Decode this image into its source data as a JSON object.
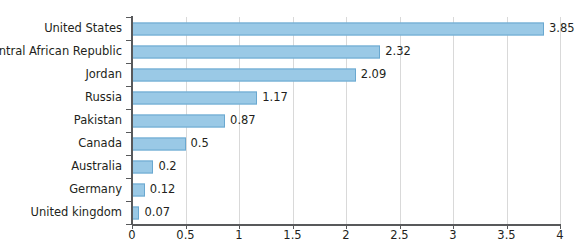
{
  "chart_data": {
    "type": "bar",
    "orientation": "horizontal",
    "title": "",
    "subtitle": "",
    "xlabel": "",
    "ylabel": "",
    "xlim": [
      0,
      4
    ],
    "grid": true,
    "legend": null,
    "xticks": [
      "0",
      "0.5",
      "1",
      "1.5",
      "2",
      "2.5",
      "3",
      "3.5",
      "4"
    ],
    "xtick_values": [
      0,
      0.5,
      1,
      1.5,
      2,
      2.5,
      3,
      3.5,
      4
    ],
    "categories": [
      "United States",
      "Central African Republic",
      "Jordan",
      "Russia",
      "Pakistan",
      "Canada",
      "Australia",
      "Germany",
      "United kingdom"
    ],
    "values": [
      3.85,
      2.32,
      2.09,
      1.17,
      0.87,
      0.5,
      0.2,
      0.12,
      0.07
    ],
    "value_labels": [
      "3.85",
      "2.32",
      "2.09",
      "1.17",
      "0.87",
      "0.5",
      "0.2",
      "0.12",
      "0.07"
    ],
    "colors": {
      "bar_fill": "#9ac9e6",
      "bar_border": "#6aa8d0",
      "gridline": "#d9d9d9",
      "axis": "#58595b",
      "text": "#231f20",
      "background": "#ffffff"
    }
  }
}
